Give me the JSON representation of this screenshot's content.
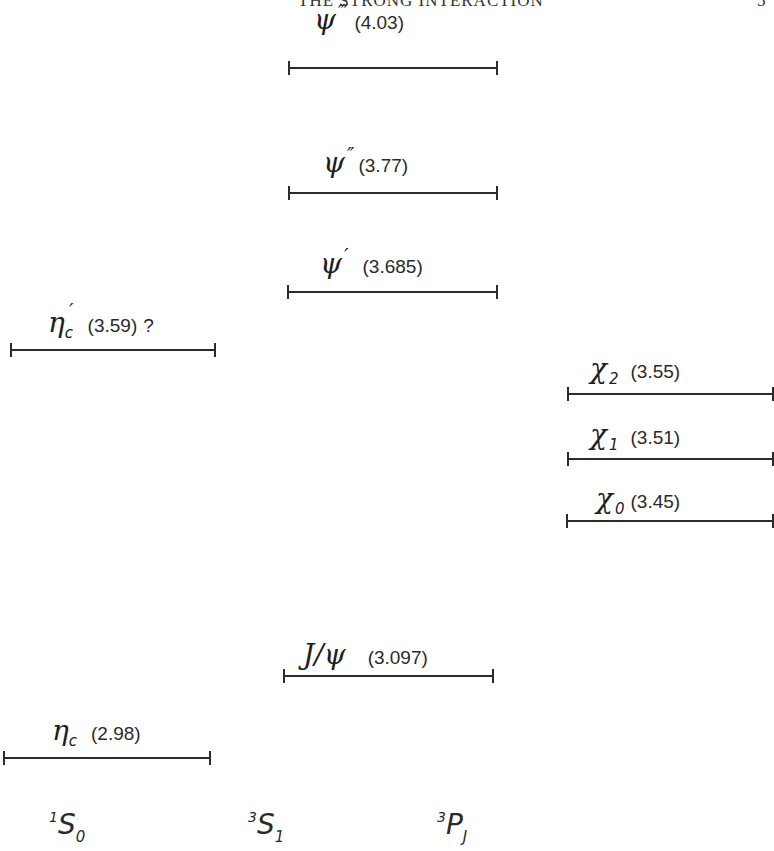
{
  "running_head": "THE STRONG INTERACTION",
  "page_number": "5",
  "columns": [
    {
      "id": "1S0",
      "pre": "1",
      "main": "S",
      "post": "0"
    },
    {
      "id": "3S1",
      "pre": "3",
      "main": "S",
      "post": "1"
    },
    {
      "id": "3PJ",
      "pre": "3",
      "main": "P",
      "post": "J"
    }
  ],
  "levels": {
    "psi3": {
      "symbol": "ψ",
      "prime": "‴",
      "sub": "",
      "mass": "(4.03)",
      "column": "3S1"
    },
    "psi2": {
      "symbol": "ψ",
      "prime": "″",
      "sub": "",
      "mass": "(3.77)",
      "column": "3S1"
    },
    "psi1": {
      "symbol": "ψ",
      "prime": "′",
      "sub": "",
      "mass": "(3.685)",
      "column": "3S1"
    },
    "etac_prime": {
      "symbol": "η",
      "prime": "′",
      "sub": "c",
      "mass": "(3.59)",
      "note": "?",
      "column": "1S0"
    },
    "chi2": {
      "symbol": "χ",
      "prime": "",
      "sub": "2",
      "mass": "(3.55)",
      "column": "3PJ"
    },
    "chi1": {
      "symbol": "χ",
      "prime": "",
      "sub": "1",
      "mass": "(3.51)",
      "column": "3PJ"
    },
    "chi0": {
      "symbol": "χ",
      "prime": "",
      "sub": "0",
      "mass": "(3.45)",
      "column": "3PJ"
    },
    "jpsi": {
      "symbol": "J/ψ",
      "prime": "",
      "sub": "",
      "mass": "(3.097)",
      "column": "3S1"
    },
    "etac": {
      "symbol": "η",
      "prime": "",
      "sub": "c",
      "mass": "(2.98)",
      "column": "1S0"
    }
  }
}
